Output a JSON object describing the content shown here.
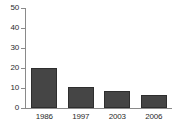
{
  "chart_data": {
    "type": "bar",
    "title": "",
    "subtitle": "",
    "xlabel": "",
    "ylabel": "",
    "categories": [
      "1986",
      "1997",
      "2003",
      "2006"
    ],
    "values": [
      20,
      10.5,
      8.5,
      6.5
    ],
    "series": [
      {
        "name": "",
        "values": [
          20,
          10.5,
          8.5,
          6.5
        ]
      }
    ],
    "ylim": [
      0,
      50
    ],
    "y_ticks": [
      0,
      10,
      20,
      30,
      40,
      50
    ],
    "y_tick_labels": [
      "0",
      "10",
      "20",
      "30",
      "40",
      "50"
    ],
    "grid": false,
    "legend": false,
    "legend_position": "none",
    "bar_color": "#454545",
    "bar_edge_color": "#2e2e2e",
    "axis_color": "#8a8a8a",
    "text_color": "#2b2b2b",
    "background_color": "#ffffff"
  }
}
